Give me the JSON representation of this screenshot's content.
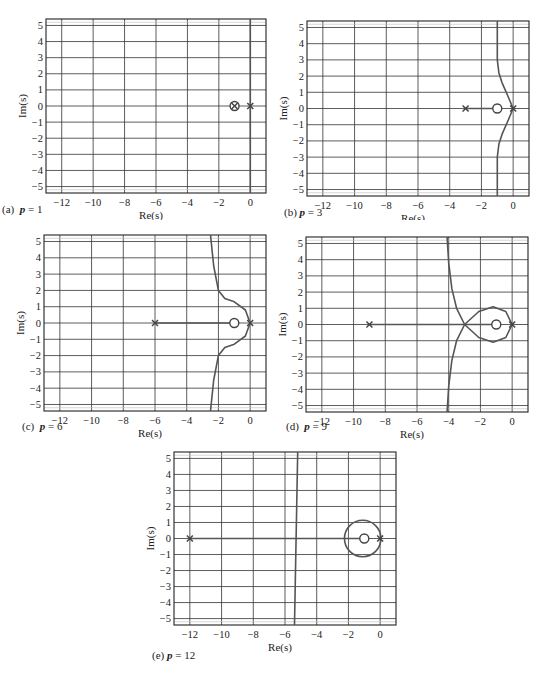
{
  "figure": {
    "xlabel": "Re(s)",
    "ylabel": "Im(s)",
    "xticks": [
      -12,
      -10,
      -8,
      -6,
      -4,
      -2,
      0
    ],
    "yticks": [
      5,
      4,
      3,
      2,
      1,
      0,
      -1,
      -2,
      -3,
      -4,
      -5
    ],
    "xlim": [
      -13,
      1
    ],
    "ylim": [
      -5.4,
      5.4
    ]
  },
  "panels": [
    {
      "id": "a",
      "caption_prefix": "(a)",
      "param": "p",
      "value": "1",
      "caption": "(a)  p = 1"
    },
    {
      "id": "b",
      "caption_prefix": "(b)",
      "param": "p",
      "value": "3",
      "caption": "(b) p = 3"
    },
    {
      "id": "c",
      "caption_prefix": "(c)",
      "param": "p",
      "value": "6",
      "caption": "(c)  p = 6"
    },
    {
      "id": "d",
      "caption_prefix": "(d)",
      "param": "p",
      "value": "9",
      "caption": "(d)  p = 9"
    },
    {
      "id": "e",
      "caption_prefix": "(e)",
      "param": "p",
      "value": "12",
      "caption": "(e) p = 12"
    }
  ],
  "chart_data": [
    {
      "type": "line",
      "title": "(a) p = 1",
      "xlabel": "Re(s)",
      "ylabel": "Im(s)",
      "xlim": [
        -13,
        1
      ],
      "ylim": [
        -5.4,
        5.4
      ],
      "grid": true,
      "poles": [
        [
          0,
          0
        ],
        [
          -1,
          0
        ]
      ],
      "zeros": [
        [
          -1,
          0
        ]
      ],
      "series": [
        {
          "name": "root locus branch",
          "x": [
            0,
            0
          ],
          "y": [
            -5.4,
            5.4
          ]
        }
      ]
    },
    {
      "type": "line",
      "title": "(b) p = 3",
      "xlabel": "Re(s)",
      "ylabel": "Im(s)",
      "xlim": [
        -13,
        1
      ],
      "ylim": [
        -5.4,
        5.4
      ],
      "grid": true,
      "poles": [
        [
          0,
          0
        ],
        [
          -3,
          0
        ]
      ],
      "zeros": [
        [
          -1,
          0
        ]
      ],
      "series": [
        {
          "name": "real-axis segment",
          "x": [
            -3,
            -1
          ],
          "y": [
            0,
            0
          ]
        },
        {
          "name": "upper branch",
          "x": [
            0,
            -0.3,
            -0.7,
            -0.9,
            -1,
            -1
          ],
          "y": [
            0,
            0.7,
            1.6,
            2.2,
            3,
            5.4
          ]
        },
        {
          "name": "lower branch",
          "x": [
            0,
            -0.3,
            -0.7,
            -0.9,
            -1,
            -1
          ],
          "y": [
            0,
            -0.7,
            -1.6,
            -2.2,
            -3,
            -5.4
          ]
        }
      ]
    },
    {
      "type": "line",
      "title": "(c) p = 6",
      "xlabel": "Re(s)",
      "ylabel": "Im(s)",
      "xlim": [
        -13,
        1
      ],
      "ylim": [
        -5.4,
        5.4
      ],
      "grid": true,
      "poles": [
        [
          0,
          0
        ],
        [
          -6,
          0
        ]
      ],
      "zeros": [
        [
          -1,
          0
        ]
      ],
      "series": [
        {
          "name": "real-axis segment",
          "x": [
            -6,
            -1
          ],
          "y": [
            0,
            0
          ]
        },
        {
          "name": "upper branch",
          "x": [
            0,
            -0.3,
            -1,
            -1.6,
            -2,
            -2.3,
            -2.5
          ],
          "y": [
            0,
            0.8,
            1.3,
            1.5,
            2,
            3.5,
            5.4
          ]
        },
        {
          "name": "lower branch",
          "x": [
            0,
            -0.3,
            -1,
            -1.6,
            -2,
            -2.3,
            -2.5
          ],
          "y": [
            0,
            -0.8,
            -1.3,
            -1.5,
            -2,
            -3.5,
            -5.4
          ]
        }
      ]
    },
    {
      "type": "line",
      "title": "(d) p = 9",
      "xlabel": "Re(s)",
      "ylabel": "Im(s)",
      "xlim": [
        -13,
        1
      ],
      "ylim": [
        -5.4,
        5.4
      ],
      "grid": true,
      "poles": [
        [
          0,
          0
        ],
        [
          -9,
          0
        ]
      ],
      "zeros": [
        [
          -1,
          0
        ]
      ],
      "series": [
        {
          "name": "real-axis segment",
          "x": [
            -9,
            -1
          ],
          "y": [
            0,
            0
          ]
        },
        {
          "name": "loop upper",
          "x": [
            0,
            -0.4,
            -1.2,
            -2.1,
            -3
          ],
          "y": [
            0,
            0.8,
            1.1,
            0.8,
            0
          ]
        },
        {
          "name": "loop lower",
          "x": [
            0,
            -0.4,
            -1.2,
            -2.1,
            -3
          ],
          "y": [
            0,
            -0.8,
            -1.1,
            -0.8,
            0
          ]
        },
        {
          "name": "upper asymptotic branch",
          "x": [
            -3,
            -3.5,
            -3.8,
            -4,
            -4.1
          ],
          "y": [
            0,
            1,
            2.2,
            3.8,
            5.4
          ]
        },
        {
          "name": "lower asymptotic branch",
          "x": [
            -3,
            -3.5,
            -3.8,
            -4,
            -4.1
          ],
          "y": [
            0,
            -1,
            -2.2,
            -3.8,
            -5.4
          ]
        }
      ]
    },
    {
      "type": "line",
      "title": "(e) p = 12",
      "xlabel": "Re(s)",
      "ylabel": "Im(s)",
      "xlim": [
        -13,
        1
      ],
      "ylim": [
        -5.4,
        5.4
      ],
      "grid": true,
      "poles": [
        [
          0,
          0
        ],
        [
          -12,
          0
        ]
      ],
      "zeros": [
        [
          -1,
          0
        ]
      ],
      "series": [
        {
          "name": "real-axis segment",
          "x": [
            -12,
            -1
          ],
          "y": [
            0,
            0
          ]
        },
        {
          "name": "circle around zero",
          "center": [
            -1.1,
            0
          ],
          "radius": 1.15
        },
        {
          "name": "near-vertical branch",
          "x": [
            -5.2,
            -5.3,
            -5.4
          ],
          "y": [
            5.4,
            0,
            -5.4
          ]
        }
      ]
    }
  ]
}
